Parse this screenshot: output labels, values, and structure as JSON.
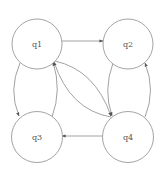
{
  "diagram": {
    "type": "state-transition-graph",
    "colors": {
      "node_stroke": "#9a9a9a",
      "edge_stroke": "#8a8a8a",
      "label": "#555555",
      "background": "#ffffff"
    },
    "nodes": [
      {
        "id": "q1",
        "label": "q1",
        "cx": 37,
        "cy": 44,
        "r": 25
      },
      {
        "id": "q2",
        "label": "q2",
        "cx": 128,
        "cy": 44,
        "r": 25
      },
      {
        "id": "q3",
        "label": "q3",
        "cx": 37,
        "cy": 137,
        "r": 25.5
      },
      {
        "id": "q4",
        "label": "q4",
        "cx": 128,
        "cy": 137,
        "r": 25.5
      }
    ],
    "edges": [
      {
        "from": "q1",
        "to": "q2",
        "shape": "straight"
      },
      {
        "from": "q4",
        "to": "q3",
        "shape": "straight"
      },
      {
        "from": "q1",
        "to": "q4",
        "shape": "curved"
      },
      {
        "from": "q4",
        "to": "q1",
        "shape": "curved"
      },
      {
        "from": "q1",
        "to": "q3",
        "shape": "curved"
      },
      {
        "from": "q3",
        "to": "q1",
        "shape": "curved"
      },
      {
        "from": "q2",
        "to": "q4",
        "shape": "curved"
      },
      {
        "from": "q4",
        "to": "q2",
        "shape": "curved"
      }
    ]
  }
}
